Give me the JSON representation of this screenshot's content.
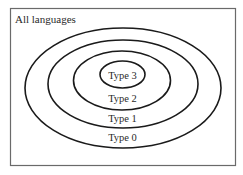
{
  "diagram": {
    "title": "All languages",
    "sets": [
      {
        "id": "type0",
        "label": "Type 0"
      },
      {
        "id": "type1",
        "label": "Type 1"
      },
      {
        "id": "type2",
        "label": "Type 2"
      },
      {
        "id": "type3",
        "label": "Type 3"
      }
    ],
    "colors": {
      "background": "#ffffff",
      "ellipse_stroke": "#1a1a1a",
      "frame_stroke": "#6a6a6a",
      "text": "#2a2a2a"
    }
  }
}
